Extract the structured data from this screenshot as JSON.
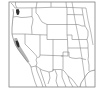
{
  "map": {
    "type": "range-map",
    "region": "Western United States",
    "frame": {
      "x": 9,
      "y": 2,
      "width": 86,
      "height": 85
    },
    "colors": {
      "background": "#ffffff",
      "frame": "#6e6e6e",
      "borders": "#7a7a7a",
      "range_high": "#2e2e2e",
      "range_low": "#9a9a9a"
    },
    "highlighted_regions": [
      {
        "name": "puget-sound-area",
        "intensity": "high"
      },
      {
        "name": "california-coast",
        "intensity": "medium"
      },
      {
        "name": "san-francisco-bay-area",
        "intensity": "high"
      }
    ]
  }
}
